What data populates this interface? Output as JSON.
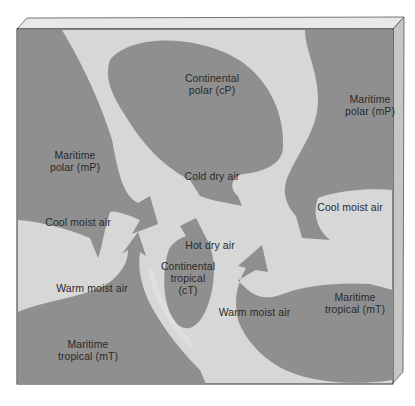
{
  "diagram": {
    "colors": {
      "background": "#d7d7d7",
      "air_mass": "#8f8f8f",
      "frame_top": "#e6e6e6",
      "frame_side": "#c4c4c4",
      "border": "#333333",
      "text": "#2a2a2a"
    },
    "air_masses": [
      {
        "id": "cP",
        "line1": "Continental",
        "line2": "polar (cP)"
      },
      {
        "id": "mP_west",
        "line1": "Maritime",
        "line2": "polar (mP)"
      },
      {
        "id": "mP_east",
        "line1": "Maritime",
        "line2": "polar (mP)"
      },
      {
        "id": "cT",
        "line1": "Continental",
        "line2": "tropical",
        "line3": "(cT)"
      },
      {
        "id": "mT_west",
        "line1": "Maritime",
        "line2": "tropical (mT)"
      },
      {
        "id": "mT_east",
        "line1": "Maritime",
        "line2": "tropical (mT)"
      }
    ],
    "flows": [
      {
        "id": "cold_dry",
        "label": "Cold dry air"
      },
      {
        "id": "cool_moist_west",
        "label": "Cool moist air"
      },
      {
        "id": "cool_moist_east",
        "label": "Cool moist air"
      },
      {
        "id": "hot_dry",
        "label": "Hot dry air"
      },
      {
        "id": "warm_moist_west",
        "label": "Warm moist air"
      },
      {
        "id": "warm_moist_east",
        "label": "Warm moist air"
      }
    ]
  }
}
